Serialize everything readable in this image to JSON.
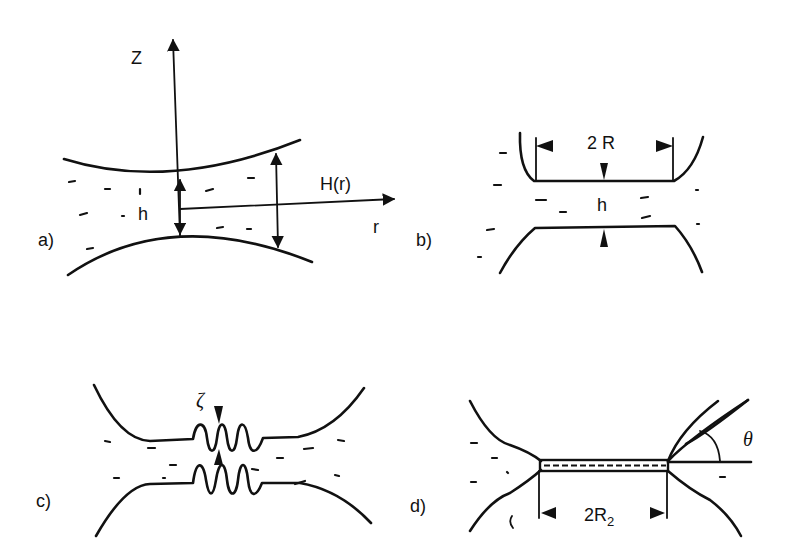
{
  "figure": {
    "panels": [
      {
        "id": "a",
        "label": "a)",
        "description": "Thin liquid film between two curved interfaces",
        "labels": {
          "axis_z": "Z",
          "axis_r": "r",
          "thickness": "h",
          "profile": "H(r)"
        }
      },
      {
        "id": "b",
        "label": "b)",
        "description": "Plane-parallel film of radius R",
        "labels": {
          "radius": "2 R",
          "thickness": "h"
        }
      },
      {
        "id": "c",
        "label": "c)",
        "description": "Film with surface undulations of amplitude zeta",
        "labels": {
          "amplitude": "ζ"
        }
      },
      {
        "id": "d",
        "label": "d)",
        "description": "Black film with contact angle theta",
        "labels": {
          "radius_prefix": "2R",
          "radius_sub": "2",
          "angle": "θ"
        }
      }
    ]
  }
}
